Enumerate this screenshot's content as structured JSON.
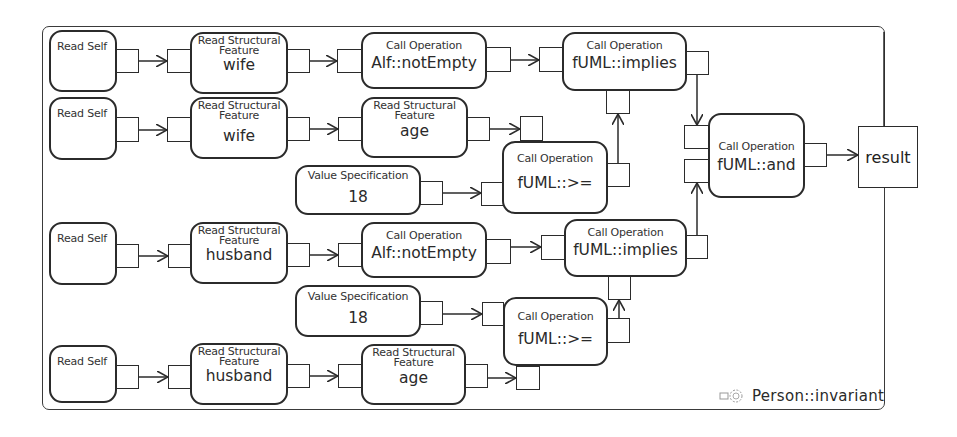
{
  "diagram": {
    "frame_label": "Person::invariant",
    "frame_icon": "activity-icon",
    "result_label": "result",
    "nodes": {
      "read_self_1": {
        "kind": "Read Self"
      },
      "rsf_wife_1": {
        "kind": "Read Structural Feature",
        "kind_line1": "Read Structural",
        "kind_line2": "Feature",
        "value": "wife"
      },
      "call_notempty_1": {
        "kind": "Call Operation",
        "value": "Alf::notEmpty"
      },
      "call_implies_1": {
        "kind": "Call Operation",
        "value": "fUML::implies"
      },
      "read_self_2": {
        "kind": "Read Self"
      },
      "rsf_wife_2": {
        "kind": "Read Structural Feature",
        "kind_line1": "Read Structural",
        "kind_line2": "Feature",
        "value": "wife"
      },
      "rsf_age_1": {
        "kind": "Read Structural Feature",
        "kind_line1": "Read Structural",
        "kind_line2": "Feature",
        "value": "age"
      },
      "value_spec_1": {
        "kind": "Value Specification",
        "value": "18"
      },
      "call_gte_1": {
        "kind": "Call Operation",
        "value": "fUML::>="
      },
      "call_and": {
        "kind": "Call Operation",
        "value": "fUML::and"
      },
      "read_self_3": {
        "kind": "Read Self"
      },
      "rsf_husband_1": {
        "kind": "Read Structural Feature",
        "kind_line1": "Read Structural",
        "kind_line2": "Feature",
        "value": "husband"
      },
      "call_notempty_2": {
        "kind": "Call Operation",
        "value": "Alf::notEmpty"
      },
      "call_implies_2": {
        "kind": "Call Operation",
        "value": "fUML::implies"
      },
      "value_spec_2": {
        "kind": "Value Specification",
        "value": "18"
      },
      "call_gte_2": {
        "kind": "Call Operation",
        "value": "fUML::>="
      },
      "read_self_4": {
        "kind": "Read Self"
      },
      "rsf_husband_2": {
        "kind": "Read Structural Feature",
        "kind_line1": "Read Structural",
        "kind_line2": "Feature",
        "value": "husband"
      },
      "rsf_age_2": {
        "kind": "Read Structural Feature",
        "kind_line1": "Read Structural",
        "kind_line2": "Feature",
        "value": "age"
      }
    },
    "edges": [
      {
        "from": "read_self_1",
        "to": "rsf_wife_1"
      },
      {
        "from": "rsf_wife_1",
        "to": "call_notempty_1"
      },
      {
        "from": "call_notempty_1",
        "to": "call_implies_1"
      },
      {
        "from": "read_self_2",
        "to": "rsf_wife_2"
      },
      {
        "from": "rsf_wife_2",
        "to": "rsf_age_1"
      },
      {
        "from": "rsf_age_1",
        "to": "call_gte_1"
      },
      {
        "from": "value_spec_1",
        "to": "call_gte_1"
      },
      {
        "from": "call_gte_1",
        "to": "call_implies_1"
      },
      {
        "from": "call_implies_1",
        "to": "call_and"
      },
      {
        "from": "call_implies_2",
        "to": "call_and"
      },
      {
        "from": "call_and",
        "to": "result"
      },
      {
        "from": "read_self_3",
        "to": "rsf_husband_1"
      },
      {
        "from": "rsf_husband_1",
        "to": "call_notempty_2"
      },
      {
        "from": "call_notempty_2",
        "to": "call_implies_2"
      },
      {
        "from": "value_spec_2",
        "to": "call_gte_2"
      },
      {
        "from": "call_gte_2",
        "to": "call_implies_2"
      },
      {
        "from": "read_self_4",
        "to": "rsf_husband_2"
      },
      {
        "from": "rsf_husband_2",
        "to": "rsf_age_2"
      },
      {
        "from": "rsf_age_2",
        "to": "call_gte_2"
      }
    ]
  }
}
